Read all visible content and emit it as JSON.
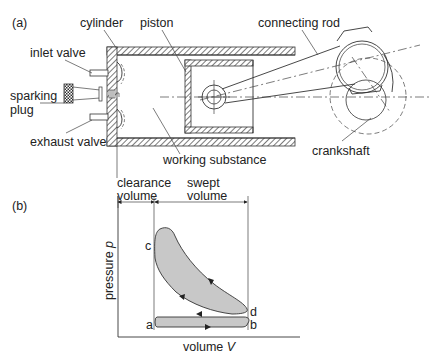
{
  "figure": {
    "part_a": {
      "label": "(a)",
      "labels": {
        "cylinder": "cylinder",
        "piston": "piston",
        "connecting_rod": "connecting rod",
        "inlet_valve": "inlet valve",
        "sparking_plug_line1": "sparking",
        "sparking_plug_line2": "plug",
        "exhaust_valve": "exhaust valve",
        "working_substance": "working substance",
        "crankshaft": "crankshaft"
      }
    },
    "part_b": {
      "label": "(b)",
      "clearance_volume_line1": "clearance",
      "clearance_volume_line2": "volume",
      "swept_volume_line1": "swept",
      "swept_volume_line2": "volume",
      "y_axis_label": "pressure",
      "y_axis_symbol": "p",
      "x_axis_label": "volume",
      "x_axis_symbol": "V",
      "points": {
        "a": "a",
        "b": "b",
        "c": "c",
        "d": "d"
      },
      "fill_color": "#c8c8c8",
      "stroke_color": "#333333"
    }
  }
}
